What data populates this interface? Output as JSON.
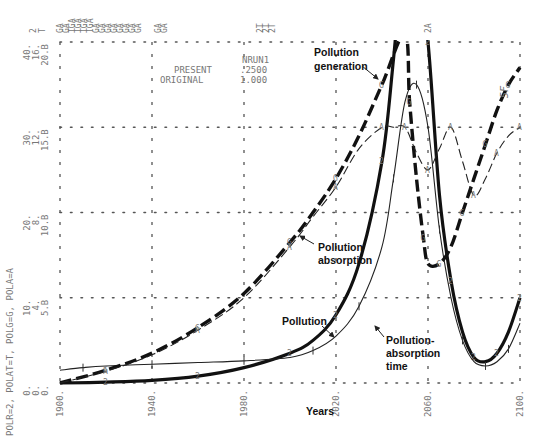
{
  "chart_data": {
    "type": "line",
    "title": "",
    "xlabel": "Years",
    "ylabel": "POLR=2, POLAT=T, POLG=G, POLA=A",
    "x_ticks": [
      "1900.",
      "1940.",
      "1980.",
      "2020.",
      "2060.",
      "2100."
    ],
    "x_values": [
      1900,
      1940,
      1980,
      2020,
      2060,
      2100
    ],
    "xlim": [
      1900,
      2100
    ],
    "ylim": [
      0,
      40
    ],
    "y_tick_values": [
      0,
      10,
      20,
      30,
      40
    ],
    "y_axis_label_columns": [
      [
        "0.",
        "10.",
        "20.",
        "30.",
        "40."
      ],
      [
        "0.",
        "4.",
        "8.",
        "12.",
        "16."
      ],
      [
        "0.",
        "5.B",
        "10.B",
        "15.B",
        "20.B"
      ]
    ],
    "grid": true,
    "run_info": {
      "header": "NRUN1",
      "rows": [
        {
          "label": "PRESENT",
          "value": ".2500"
        },
        {
          "label": "ORIGINAL",
          "value": "1.000"
        }
      ]
    },
    "top_markers": [
      "2",
      "T",
      "GA",
      "GA",
      "TGA",
      "TGA",
      "TGA",
      "TGA",
      "GA",
      "GA",
      "GA",
      "GA",
      "GA",
      "GA",
      "GA",
      "GA",
      "GA",
      "GA",
      "2T",
      "2T",
      "2T",
      "2A"
    ],
    "corner_note": "5F",
    "series": [
      {
        "name": "Pollution",
        "symbol": "2",
        "style": "thick-solid",
        "x": [
          1900,
          1920,
          1940,
          1960,
          1980,
          2000,
          2010,
          2020,
          2030,
          2040,
          2045,
          2050,
          2055,
          2060,
          2065,
          2070,
          2075,
          2080,
          2085,
          2090,
          2095,
          2100
        ],
        "y": [
          0,
          0.1,
          0.3,
          0.8,
          1.8,
          3.5,
          5.0,
          8.0,
          14.0,
          26.0,
          38.0,
          52.0,
          50.0,
          40.0,
          22.0,
          12.0,
          6.0,
          3.0,
          2.5,
          3.5,
          6.0,
          10.0
        ]
      },
      {
        "name": "Pollution-absorption time",
        "symbol": "T",
        "style": "thin-solid",
        "x": [
          1900,
          1910,
          1920,
          1940,
          1960,
          1980,
          2000,
          2010,
          2020,
          2030,
          2040,
          2045,
          2050,
          2055,
          2060,
          2065,
          2070,
          2075,
          2080,
          2085,
          2090,
          2095,
          2100
        ],
        "y": [
          1.5,
          1.8,
          2.0,
          2.2,
          2.4,
          2.6,
          3.0,
          3.8,
          5.5,
          9.0,
          16.0,
          24.0,
          33.0,
          35.0,
          30.0,
          18.0,
          10.0,
          5.0,
          2.5,
          2.0,
          2.5,
          4.0,
          7.0
        ]
      },
      {
        "name": "Pollution generation",
        "symbol": "G",
        "style": "thick-dashed",
        "x": [
          1900,
          1920,
          1940,
          1960,
          1980,
          2000,
          2010,
          2020,
          2030,
          2040,
          2050,
          2052,
          2055,
          2058,
          2060,
          2065,
          2070,
          2075,
          2080,
          2085,
          2090,
          2095,
          2100
        ],
        "y": [
          0,
          1.5,
          3.5,
          6.5,
          10.5,
          16.5,
          20.0,
          24.0,
          29.0,
          35.0,
          41.0,
          33.0,
          24.0,
          17.0,
          14.0,
          14.0,
          16.0,
          20.0,
          24.0,
          28.0,
          32.0,
          35.0,
          37.0
        ]
      },
      {
        "name": "Pollution absorption",
        "symbol": "A",
        "style": "thin-dashed",
        "x": [
          1900,
          1920,
          1940,
          1960,
          1980,
          2000,
          2010,
          2020,
          2030,
          2040,
          2045,
          2050,
          2055,
          2060,
          2065,
          2070,
          2075,
          2080,
          2085,
          2090,
          2095,
          2100
        ],
        "y": [
          0,
          1.4,
          3.3,
          6.2,
          10.0,
          16.0,
          19.5,
          23.0,
          27.5,
          30.0,
          30.0,
          30.0,
          27.0,
          25.0,
          27.5,
          30.0,
          26.0,
          22.0,
          24.0,
          27.0,
          29.0,
          30.0
        ]
      }
    ],
    "annotations": [
      {
        "text": [
          "Pollution",
          "generation"
        ],
        "target": "Pollution generation"
      },
      {
        "text": [
          "Pollution",
          "absorption"
        ],
        "target": "Pollution absorption"
      },
      {
        "text": [
          "Pollution"
        ],
        "target": "Pollution"
      },
      {
        "text": [
          "Pollution-",
          "absorption",
          "time"
        ],
        "target": "Pollution-absorption time"
      }
    ]
  }
}
